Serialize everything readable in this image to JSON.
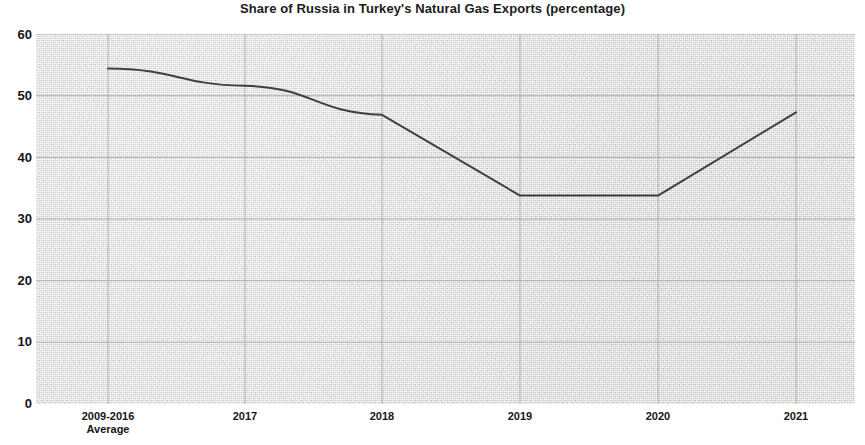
{
  "chart_data": {
    "type": "line",
    "title": "Share of Russia in Turkey's Natural Gas Exports (percentage)",
    "xlabel": "",
    "ylabel": "",
    "categories": [
      "2009-2016 Average",
      "2017",
      "2018",
      "2019",
      "2020",
      "2021"
    ],
    "category_lines": [
      [
        "2009-2016",
        "Average"
      ],
      [
        "2017",
        ""
      ],
      [
        "2018",
        ""
      ],
      [
        "2019",
        ""
      ],
      [
        "2020",
        ""
      ],
      [
        "2021",
        ""
      ]
    ],
    "values": [
      54.4,
      51.6,
      46.9,
      33.8,
      33.8,
      47.3
    ],
    "series": [
      {
        "name": "Share of Russia",
        "values": [
          54.4,
          51.6,
          46.9,
          33.8,
          33.8,
          47.3
        ]
      }
    ],
    "ylim": [
      0,
      60
    ],
    "yticks": [
      0,
      10,
      20,
      30,
      40,
      50,
      60
    ],
    "ytick_labels": [
      "0",
      "10",
      "20",
      "30",
      "40",
      "50",
      "60"
    ],
    "grid": true,
    "grid_axis": "both",
    "legend": false,
    "legend_position": "none",
    "line_color": "#3f3f3f",
    "plot_background_color": "#d9d9d9",
    "page_background_color": "#ffffff",
    "text_color": "#161616"
  }
}
